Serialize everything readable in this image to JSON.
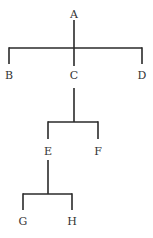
{
  "diagram": {
    "type": "tree",
    "line_color": "#2a2a2a",
    "text_color": "#333333",
    "nodes": [
      {
        "id": "A",
        "label": "A",
        "x": 74,
        "y": 15
      },
      {
        "id": "B",
        "label": "B",
        "x": 9,
        "y": 79
      },
      {
        "id": "C",
        "label": "C",
        "x": 74,
        "y": 79
      },
      {
        "id": "D",
        "label": "D",
        "x": 142,
        "y": 79
      },
      {
        "id": "E",
        "label": "E",
        "x": 48,
        "y": 156
      },
      {
        "id": "F",
        "label": "F",
        "x": 98,
        "y": 156
      },
      {
        "id": "G",
        "label": "G",
        "x": 23,
        "y": 225
      },
      {
        "id": "H",
        "label": "H",
        "x": 72,
        "y": 225
      }
    ],
    "edges": [
      {
        "from": "A",
        "to": "B"
      },
      {
        "from": "A",
        "to": "C"
      },
      {
        "from": "A",
        "to": "D"
      },
      {
        "from": "C",
        "to": "E"
      },
      {
        "from": "C",
        "to": "F"
      },
      {
        "from": "E",
        "to": "G"
      },
      {
        "from": "E",
        "to": "H"
      }
    ]
  }
}
